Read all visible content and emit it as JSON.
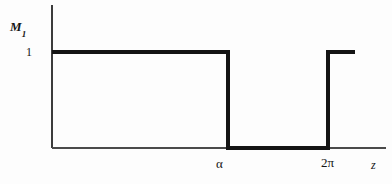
{
  "figure": {
    "kind": "step-function-plot",
    "background_color": "#fdfdfd",
    "ink_color": "#141414",
    "axis_color": "#4a4a4a"
  },
  "labels": {
    "y_axis_title_base": "M",
    "y_axis_title_subscript": "1",
    "y_tick_one": "1",
    "x_tick_alpha": "α",
    "x_tick_twopi": "2π",
    "x_axis_title": "z"
  },
  "chart_data": {
    "type": "line",
    "title": "",
    "subtitle": "",
    "xlabel": "z",
    "ylabel": "M₁",
    "grid": false,
    "legend": null,
    "xlim": [
      0,
      7.85
    ],
    "ylim": [
      0,
      1.35
    ],
    "x_tick_values": [
      3.95,
      6.283
    ],
    "x_tick_labels": [
      "α",
      "2π"
    ],
    "y_tick_values": [
      1
    ],
    "y_tick_labels": [
      "1"
    ],
    "series": [
      {
        "name": "M1",
        "style": "step",
        "line_width_px": 4,
        "color": "#141414",
        "x": [
          0,
          3.95,
          3.95,
          6.283,
          6.283,
          7.35
        ],
        "values": [
          1,
          1,
          0,
          0,
          1,
          1
        ],
        "points": [
          {
            "x": 0,
            "y": 1
          },
          {
            "x": 3.95,
            "y": 1
          },
          {
            "x": 3.95,
            "y": 0
          },
          {
            "x": 6.283,
            "y": 0
          },
          {
            "x": 6.283,
            "y": 1
          },
          {
            "x": 7.35,
            "y": 1
          }
        ]
      }
    ],
    "annotations": [
      {
        "text": "M₁",
        "role": "y-axis-title"
      },
      {
        "text": "1",
        "role": "y-tick"
      },
      {
        "text": "α",
        "role": "x-tick"
      },
      {
        "text": "2π",
        "role": "x-tick"
      },
      {
        "text": "z",
        "role": "x-axis-title"
      }
    ]
  },
  "geometry": {
    "y_axis_x": 52,
    "y_axis_top": 5,
    "x_axis_y": 148,
    "x_axis_right": 386,
    "level_one_y": 52,
    "drop_x": 228,
    "rise_x": 328,
    "curve_right_end": 355
  }
}
